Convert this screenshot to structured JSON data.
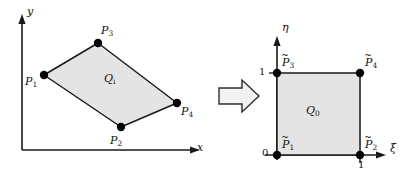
{
  "figure": {
    "background_color": "#ffffff",
    "line_color": "#1a1a1a",
    "fill_color": "#e4e4e4",
    "vertex_color": "#000000"
  },
  "left_panel": {
    "name": "physical-element",
    "axes": {
      "x_label": "x",
      "y_label": "y"
    },
    "region_label": "Q",
    "region_subscript": "i",
    "vertices": [
      {
        "id": "P1",
        "label": "P",
        "subscript": "1",
        "x": 44,
        "y": 75,
        "label_dx": -17,
        "label_dy": 4
      },
      {
        "id": "P2",
        "label": "P",
        "subscript": "2",
        "x": 121,
        "y": 127,
        "label_dx": -9,
        "label_dy": 20
      },
      {
        "id": "P3",
        "label": "P",
        "subscript": "3",
        "x": 98,
        "y": 43,
        "label_dx": 5,
        "label_dy": -16
      },
      {
        "id": "P4",
        "label": "P",
        "subscript": "4",
        "x": 177,
        "y": 103,
        "label_dx": 6,
        "label_dy": 14
      }
    ],
    "polygon_order": [
      "P1",
      "P3",
      "P4",
      "P2"
    ]
  },
  "arrow": {
    "name": "maps-to-arrow",
    "direction": "right",
    "style": "hollow-block"
  },
  "right_panel": {
    "name": "reference-element",
    "axes": {
      "x_label": "ξ",
      "y_label": "η"
    },
    "region_label": "Q",
    "region_subscript": "0",
    "tick_labels": {
      "origin": "0",
      "x_one": "1",
      "y_one": "1"
    },
    "vertices": [
      {
        "id": "P1t",
        "label": "P",
        "subscript": "1",
        "tilde": true,
        "x": 277,
        "y": 155,
        "label_dx": 5,
        "label_dy": -10
      },
      {
        "id": "P2t",
        "label": "P",
        "subscript": "2",
        "tilde": true,
        "x": 360,
        "y": 155,
        "label_dx": 5,
        "label_dy": -10
      },
      {
        "id": "P3t",
        "label": "P",
        "subscript": "3",
        "tilde": true,
        "x": 277,
        "y": 73,
        "label_dx": 5,
        "label_dy": -10
      },
      {
        "id": "P4t",
        "label": "P",
        "subscript": "4",
        "tilde": true,
        "x": 360,
        "y": 73,
        "label_dx": 5,
        "label_dy": -10
      }
    ]
  }
}
